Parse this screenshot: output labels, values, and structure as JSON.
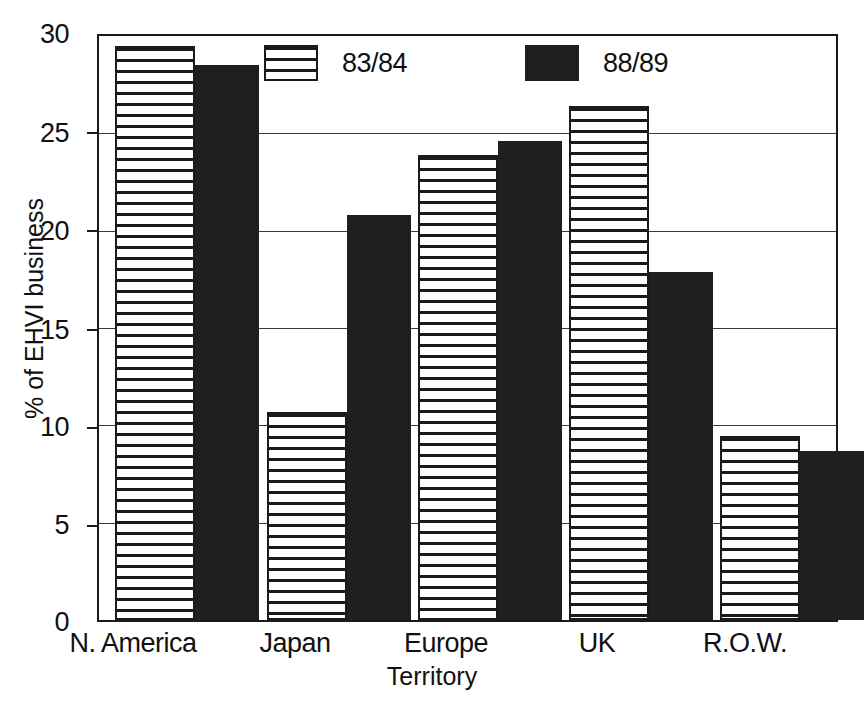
{
  "chart_data": {
    "type": "bar",
    "title": "",
    "xlabel": "Territory",
    "ylabel": "% of EHVI business",
    "categories": [
      "N. America",
      "Japan",
      "Europe",
      "UK",
      "R.O.W."
    ],
    "series": [
      {
        "name": "83/84",
        "values": [
          29.5,
          10.7,
          23.9,
          26.4,
          9.4
        ],
        "fill": "horizontal-hatch",
        "color": "#1a1a1a"
      },
      {
        "name": "88/89",
        "values": [
          28.5,
          20.8,
          24.6,
          17.9,
          8.6
        ],
        "fill": "solid",
        "color": "#1f1f1f"
      }
    ],
    "ylim": [
      0,
      30
    ],
    "yticks": [
      0,
      5,
      10,
      15,
      20,
      25,
      30
    ],
    "ytick_labels": [
      "0",
      "5",
      "10",
      "15",
      "20",
      "25",
      "30"
    ],
    "grid": true,
    "grid_axis": "y",
    "legend_position": "top-inside",
    "background": "#ffffff",
    "axis_color": "#1a1a1a"
  },
  "legend": {
    "entries": [
      {
        "label": "83/84"
      },
      {
        "label": "88/89"
      }
    ]
  }
}
